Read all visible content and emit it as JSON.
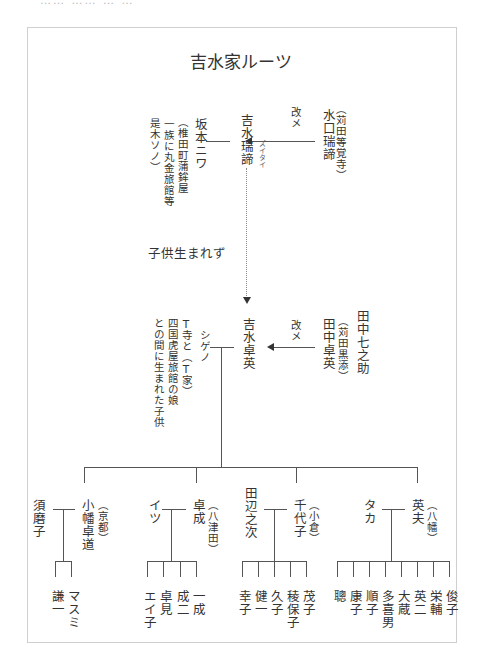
{
  "header_fragment": "…… …… … …",
  "title": "吉水家ルーツ",
  "generation1": {
    "origin_name": "水口瑞諦",
    "origin_note": "（苅田等覚寺）",
    "rename_label": "改メ",
    "main_name": "吉水瑞諦",
    "main_reading": "ズイタイ",
    "spouse_name": "坂本ニワ",
    "spouse_note_1": "（椎田町蒲鉾屋",
    "spouse_note_2": "一族に丸金旅館等",
    "spouse_note_3": "是木ソノ）",
    "no_children": "子供生まれず"
  },
  "generation2": {
    "origin_name_1": "田中七之助",
    "origin_note": "（苅田黒添）",
    "origin_name_2": "田中卓英",
    "rename_label": "改メ",
    "main_name": "吉水卓英",
    "spouse_name": "シゲノ",
    "spouse_note_1": "T寺と（T家）",
    "spouse_note_2": "四国虎屋旅館の娘",
    "spouse_note_3": "との間に生まれた子供"
  },
  "children": [
    {
      "name": "小幡卓道",
      "note": "（京都）",
      "spouse": "須磨子",
      "kids": [
        "マスミ",
        "謙一"
      ]
    },
    {
      "name": "卓成",
      "note": "（八津田）",
      "spouse": "イツ",
      "kids": [
        "一成",
        "成二",
        "卓見",
        "エイ子"
      ]
    },
    {
      "name": "千代子",
      "note": "（小倉）",
      "spouse": "田辺之次",
      "kids": [
        "茂子",
        "稜保子",
        "久子",
        "健一",
        "幸子"
      ]
    },
    {
      "name": "英夫",
      "note": "（八幡）",
      "spouse": "タカ",
      "kids": [
        "俊子",
        "栄輔",
        "英二",
        "大蔵",
        "多喜男",
        "順子",
        "康子",
        "聰"
      ]
    }
  ]
}
